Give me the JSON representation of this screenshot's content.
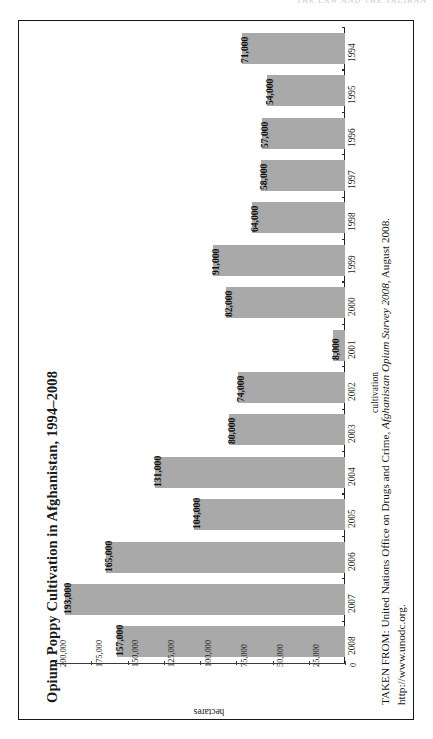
{
  "page": {
    "running_head": "THE LAW AND THE TALIBAN"
  },
  "figure": {
    "title": "Opium Poppy Cultivation in Afghanistan, 1994–2008",
    "bar_color": "#a9a9a9",
    "frame_color": "#171717"
  },
  "chart_data": {
    "type": "bar",
    "orientation": "horizontal",
    "title": "Opium Poppy Cultivation in Afghanistan, 1994–2008",
    "xlabel": "hectares",
    "ylabel": "cultivation",
    "categories": [
      "1994",
      "1995",
      "1996",
      "1997",
      "1998",
      "1999",
      "2000",
      "2001",
      "2002",
      "2003",
      "2004",
      "2005",
      "2006",
      "2007",
      "2008"
    ],
    "values": [
      71000,
      54000,
      57000,
      58000,
      64000,
      91000,
      82000,
      8000,
      74000,
      80000,
      131000,
      104000,
      165000,
      193000,
      157000
    ],
    "value_labels": [
      "71,000",
      "54,000",
      "57,000",
      "58,000",
      "64,000",
      "91,000",
      "82,000",
      "8,000",
      "74,000",
      "80,000",
      "131,000",
      "104,000",
      "165,000",
      "193,000",
      "157,000"
    ],
    "xlim": [
      0,
      200000
    ],
    "tick_labels": [
      "0",
      "25,000",
      "50,000",
      "75,000",
      "100,000",
      "125,000",
      "150,000",
      "175,000",
      "200,000"
    ],
    "tick_values": [
      0,
      25000,
      50000,
      75000,
      100000,
      125000,
      150000,
      175000,
      200000
    ],
    "grid": false,
    "legend": null,
    "series_color": "#a9a9a9"
  },
  "source": {
    "line1_prefix": "TAKEN FROM: United Nations Office on Drugs and Crime, ",
    "line1_italic": "Afghanistan Opium Survey 2008",
    "line1_suffix": ", August 2008.",
    "line2": "http://www.unodc.org."
  }
}
